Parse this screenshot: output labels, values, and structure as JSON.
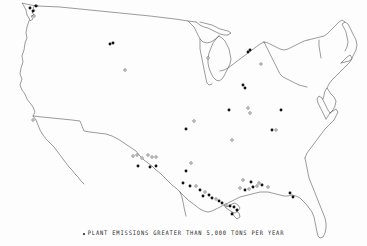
{
  "figure": {
    "kind": "point-map",
    "region": "united-states-lower-48",
    "background_color": "#fdfdfd",
    "outline_color": "#4a4a4a",
    "marker_filled_color": "#111111",
    "marker_open_color": "#ffffff"
  },
  "caption": {
    "bullet_symbol": "•",
    "text": "PLANT EMISSIONS GREATER THAN 5,000 TONS PER YEAR"
  },
  "legend": {
    "marker_label": "PLANT EMISSIONS GREATER THAN 5,000 TONS PER YEAR",
    "threshold_value": "5,000",
    "threshold_units": "TONS PER YEAR"
  },
  "chart_data": {
    "type": "scatter",
    "title": "",
    "subtitle": "",
    "xlabel": "",
    "ylabel": "",
    "legend_position": "bottom-center",
    "grid": false,
    "projection": "conic-usa",
    "xlim": [
      0,
      367
    ],
    "ylim": [
      0,
      246
    ],
    "note": "Each marker is one plant emitting more than 5,000 tons per year. Coordinates are figure pixel positions.",
    "series": [
      {
        "name": "PLANT EMISSIONS GREATER THAN 5,000 TONS PER YEAR",
        "marker": "dot",
        "count": 62,
        "points": [
          {
            "x": 30,
            "y": 8,
            "style": "filled"
          },
          {
            "x": 33,
            "y": 11,
            "style": "filled"
          },
          {
            "x": 34,
            "y": 16,
            "style": "open"
          },
          {
            "x": 36,
            "y": 6,
            "style": "filled"
          },
          {
            "x": 110,
            "y": 44,
            "style": "filled"
          },
          {
            "x": 113,
            "y": 43,
            "style": "filled"
          },
          {
            "x": 125,
            "y": 70,
            "style": "open"
          },
          {
            "x": 33,
            "y": 120,
            "style": "open"
          },
          {
            "x": 208,
            "y": 58,
            "style": "open"
          },
          {
            "x": 248,
            "y": 52,
            "style": "filled"
          },
          {
            "x": 250,
            "y": 50,
            "style": "filled"
          },
          {
            "x": 261,
            "y": 64,
            "style": "open"
          },
          {
            "x": 243,
            "y": 85,
            "style": "filled"
          },
          {
            "x": 245,
            "y": 88,
            "style": "filled"
          },
          {
            "x": 229,
            "y": 110,
            "style": "filled"
          },
          {
            "x": 248,
            "y": 108,
            "style": "open"
          },
          {
            "x": 250,
            "y": 113,
            "style": "open"
          },
          {
            "x": 281,
            "y": 110,
            "style": "filled"
          },
          {
            "x": 232,
            "y": 140,
            "style": "open"
          },
          {
            "x": 272,
            "y": 130,
            "style": "filled"
          },
          {
            "x": 276,
            "y": 130,
            "style": "open"
          },
          {
            "x": 186,
            "y": 129,
            "style": "filled"
          },
          {
            "x": 194,
            "y": 121,
            "style": "open"
          },
          {
            "x": 133,
            "y": 156,
            "style": "open"
          },
          {
            "x": 137,
            "y": 155,
            "style": "open"
          },
          {
            "x": 142,
            "y": 158,
            "style": "open"
          },
          {
            "x": 148,
            "y": 155,
            "style": "open"
          },
          {
            "x": 152,
            "y": 157,
            "style": "open"
          },
          {
            "x": 156,
            "y": 157,
            "style": "open"
          },
          {
            "x": 138,
            "y": 166,
            "style": "filled"
          },
          {
            "x": 150,
            "y": 167,
            "style": "filled"
          },
          {
            "x": 156,
            "y": 166,
            "style": "filled"
          },
          {
            "x": 191,
            "y": 163,
            "style": "open"
          },
          {
            "x": 186,
            "y": 171,
            "style": "filled"
          },
          {
            "x": 183,
            "y": 183,
            "style": "filled"
          },
          {
            "x": 190,
            "y": 186,
            "style": "filled"
          },
          {
            "x": 196,
            "y": 186,
            "style": "open"
          },
          {
            "x": 200,
            "y": 190,
            "style": "filled"
          },
          {
            "x": 205,
            "y": 192,
            "style": "open"
          },
          {
            "x": 203,
            "y": 196,
            "style": "filled"
          },
          {
            "x": 209,
            "y": 195,
            "style": "filled"
          },
          {
            "x": 212,
            "y": 198,
            "style": "filled"
          },
          {
            "x": 216,
            "y": 199,
            "style": "open"
          },
          {
            "x": 219,
            "y": 201,
            "style": "filled"
          },
          {
            "x": 222,
            "y": 203,
            "style": "filled"
          },
          {
            "x": 226,
            "y": 205,
            "style": "open"
          },
          {
            "x": 230,
            "y": 206,
            "style": "filled"
          },
          {
            "x": 234,
            "y": 207,
            "style": "filled"
          },
          {
            "x": 237,
            "y": 210,
            "style": "filled"
          },
          {
            "x": 232,
            "y": 214,
            "style": "filled"
          },
          {
            "x": 240,
            "y": 188,
            "style": "open"
          },
          {
            "x": 245,
            "y": 190,
            "style": "filled"
          },
          {
            "x": 249,
            "y": 189,
            "style": "open"
          },
          {
            "x": 253,
            "y": 187,
            "style": "filled"
          },
          {
            "x": 257,
            "y": 186,
            "style": "open"
          },
          {
            "x": 262,
            "y": 185,
            "style": "filled"
          },
          {
            "x": 243,
            "y": 180,
            "style": "open"
          },
          {
            "x": 251,
            "y": 182,
            "style": "filled"
          },
          {
            "x": 259,
            "y": 183,
            "style": "open"
          },
          {
            "x": 268,
            "y": 187,
            "style": "open"
          },
          {
            "x": 290,
            "y": 193,
            "style": "filled"
          },
          {
            "x": 293,
            "y": 197,
            "style": "filled"
          }
        ]
      }
    ]
  }
}
